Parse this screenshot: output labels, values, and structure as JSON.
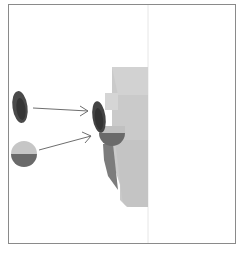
{
  "diagram": {
    "frame": {
      "x": 8,
      "y": 4,
      "width": 228,
      "height": 240,
      "border_color": "#8a8a8a"
    },
    "divider": {
      "x": 148,
      "color": "#e6e6e6"
    },
    "colors": {
      "light_gray": "#c9c9c9",
      "mid_gray": "#bdbdbd",
      "dark_gray": "#7a7a7a",
      "darker_gray": "#5a5a5a",
      "charcoal": "#3e3e3e",
      "arrow": "#6e6e6e"
    },
    "callouts": [
      {
        "name": "capsule-callout",
        "shape": "capsule",
        "target": "capsule-on-shape"
      },
      {
        "name": "half-circle-callout",
        "shape": "half-circle",
        "target": "half-circle-on-shape"
      }
    ]
  }
}
